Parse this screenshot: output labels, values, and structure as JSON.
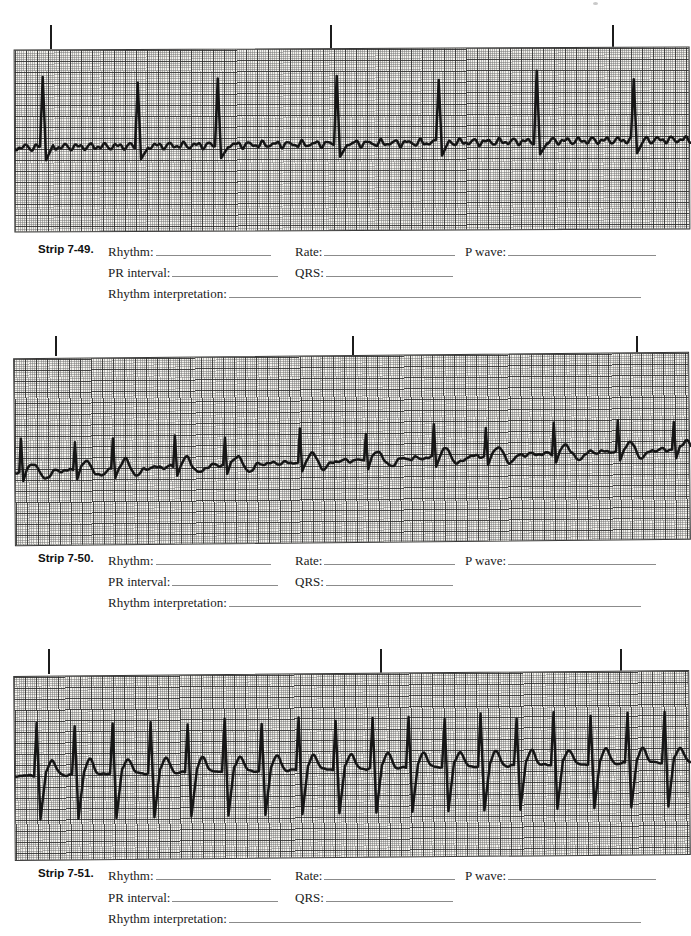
{
  "page": {
    "background": "#ffffff",
    "paper_color": "#f3f2ed",
    "grid_minor_color": "#737373",
    "grid_major_color": "#282828",
    "trace_color": "#161616"
  },
  "strips": [
    {
      "label": "Strip 7-49.",
      "fields": {
        "rhythm": "Rhythm:",
        "rate": "Rate:",
        "p_wave": "P wave:",
        "pr_interval": "PR interval:",
        "qrs": "QRS:",
        "interpretation": "Rhythm interpretation:"
      },
      "ticks_x": [
        50,
        330,
        612
      ],
      "waveform": {
        "type": "irregular-tall-narrow-QRS-fibrillatory-baseline",
        "baseline": 97,
        "slope": -5,
        "fib_amp": 4.2,
        "fib_wl1": 2.1,
        "fib_wl2": 1.25,
        "rh": 66,
        "rh_jit": 5,
        "rw": 3,
        "sw": 3,
        "sd": 13,
        "rec": 7,
        "beats": [
          28,
          123,
          203,
          322,
          424,
          522,
          619
        ]
      }
    },
    {
      "label": "Strip 7-50.",
      "fields": {
        "rhythm": "Rhythm:",
        "rate": "Rate:",
        "p_wave": "P wave:",
        "pr_interval": "PR interval:",
        "qrs": "QRS:",
        "interpretation": "Rhythm interpretation:"
      },
      "ticks_x": [
        55,
        352,
        636
      ],
      "waveform": {
        "type": "irregular-small-QRS-upward-drifting-baseline",
        "baseline": 113,
        "slope": -17,
        "fib_amp": 2.2,
        "fib_wl1": 2.3,
        "fib_wl2": 1.4,
        "rh": 30,
        "rh_jit": 4,
        "rw": 2,
        "sw": 2,
        "sd": 9,
        "rec": 4,
        "t_off": 12,
        "t_amp": 9,
        "t_w": 5,
        "d_off": 24,
        "d_amp": -7,
        "d_w": 6,
        "beats": [
          6,
          60,
          98,
          160,
          210,
          285,
          351,
          419,
          471,
          539,
          603,
          659
        ]
      }
    },
    {
      "label": "Strip 7-51.",
      "fields": {
        "rhythm": "Rhythm:",
        "rate": "Rate:",
        "p_wave": "P wave:",
        "pr_interval": "PR interval:",
        "qrs": "QRS:",
        "interpretation": "Rhythm interpretation:"
      },
      "ticks_x": [
        48,
        380,
        620
      ],
      "waveform": {
        "type": "regular-tachycardia-biphasic-QRS-peaked-waves",
        "baseline": 99,
        "slope": -8,
        "fib_amp": 1.2,
        "fib_wl1": 2.5,
        "fib_wl2": 1.6,
        "rh": 50,
        "rh_jit": 3,
        "rw": 3,
        "sw": 3,
        "sd": 44,
        "rec": 6,
        "t_off": 15,
        "t_amp": 15,
        "t_w": 5,
        "beats": [
          22,
          60,
          98,
          136,
          173,
          210,
          247,
          284,
          321,
          358,
          394,
          430,
          466,
          502,
          539,
          576,
          613,
          650
        ]
      }
    }
  ]
}
